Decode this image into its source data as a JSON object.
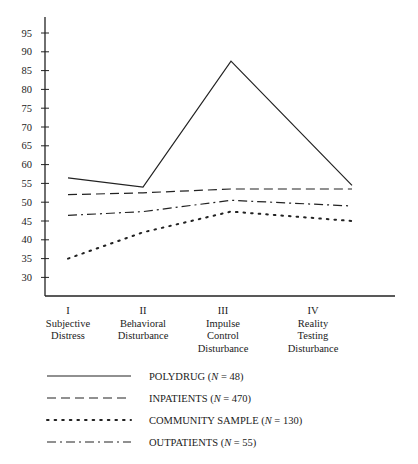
{
  "chart_data": {
    "type": "line",
    "title": "",
    "xlabel": "",
    "ylabel": "",
    "ylim": [
      25,
      97
    ],
    "y_ticks": [
      30,
      35,
      40,
      45,
      50,
      55,
      60,
      65,
      70,
      75,
      80,
      85,
      90,
      95
    ],
    "grid": false,
    "legend_position": "bottom",
    "categories": [
      [
        "I",
        "Subjective",
        "Distress"
      ],
      [
        "II",
        "Behavioral",
        "Disturbance"
      ],
      [
        "III",
        "Impulse",
        "Control",
        "Disturbance"
      ],
      [
        "IV",
        "Reality",
        "Testing",
        "Disturbance"
      ]
    ],
    "series": [
      {
        "name": "POLYDRUG",
        "n": "48",
        "style": "solid",
        "values": [
          56.5,
          54,
          87.5,
          54.5
        ]
      },
      {
        "name": "INPATIENTS",
        "n": "470",
        "style": "dashed",
        "values": [
          52,
          52.5,
          53.5,
          53.5
        ]
      },
      {
        "name": "COMMUNITY SAMPLE",
        "n": "130",
        "style": "dotted",
        "values": [
          35,
          42,
          47.5,
          45
        ]
      },
      {
        "name": "OUTPATIENTS",
        "n": "55",
        "style": "dash-dot",
        "values": [
          46.5,
          47.5,
          50.5,
          49
        ]
      }
    ]
  }
}
